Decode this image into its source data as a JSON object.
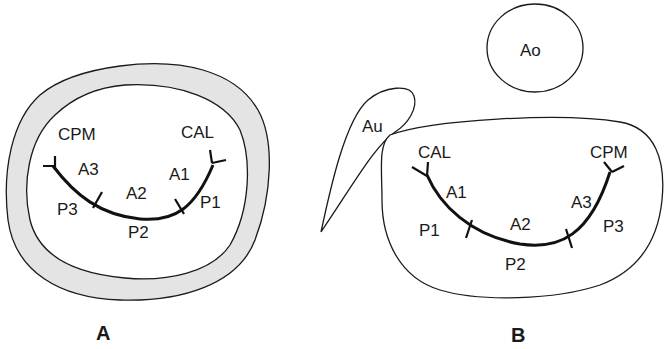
{
  "diagram": {
    "panel_a": {
      "label": "A",
      "commissures": {
        "left": "CPM",
        "right": "CAL"
      },
      "anterior_scallops": {
        "left": "A3",
        "middle": "A2",
        "right": "A1"
      },
      "posterior_scallops": {
        "left": "P3",
        "middle": "P2",
        "right": "P1"
      }
    },
    "panel_b": {
      "label": "B",
      "structures": {
        "aorta": "Ao",
        "auricle": "Au"
      },
      "commissures": {
        "left": "CAL",
        "right": "CPM"
      },
      "anterior_scallops": {
        "left": "A1",
        "middle": "A2",
        "right": "A3"
      },
      "posterior_scallops": {
        "left": "P1",
        "middle": "P2",
        "right": "P3"
      }
    },
    "colors": {
      "ring_fill": "#e4e4e4",
      "stroke": "#1a1a1a",
      "background": "#ffffff"
    }
  }
}
